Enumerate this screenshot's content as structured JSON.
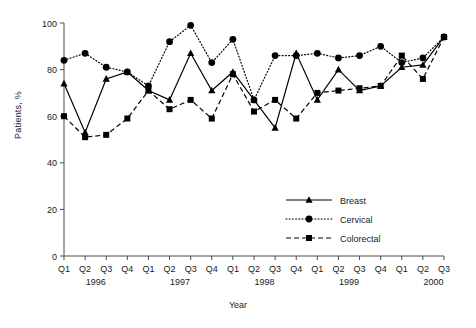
{
  "figure": {
    "ylabel": "Patients, %",
    "xlabel": "Year",
    "caption": ""
  },
  "legend": {
    "position": "inside-bottom-right",
    "items": [
      {
        "label": "Breast",
        "style": "solid",
        "marker": "triangle",
        "color": "#000000"
      },
      {
        "label": "Cervical",
        "style": "dotted",
        "marker": "circle",
        "color": "#000000"
      },
      {
        "label": "Colorectal",
        "style": "dashed",
        "marker": "square",
        "color": "#000000"
      }
    ]
  },
  "axes": {
    "y_ticks": [
      "0",
      "20",
      "40",
      "60",
      "80",
      "100"
    ],
    "y_values": [
      0,
      20,
      40,
      60,
      80,
      100
    ],
    "x_ticks": [
      "Q1",
      "Q2",
      "Q3",
      "Q4",
      "Q1",
      "Q2",
      "Q3",
      "Q4",
      "Q1",
      "Q2",
      "Q3",
      "Q4",
      "Q1",
      "Q2",
      "Q3",
      "Q4",
      "Q1",
      "Q2",
      "Q3"
    ],
    "years": [
      {
        "label": "1996",
        "index": 1.5
      },
      {
        "label": "1997",
        "index": 5.5
      },
      {
        "label": "1998",
        "index": 9.5
      },
      {
        "label": "1999",
        "index": 13.5
      },
      {
        "label": "2000",
        "index": 17.5
      }
    ]
  },
  "chart_data": {
    "type": "line",
    "title": "",
    "xlabel": "Year",
    "ylabel": "Patients, %",
    "ylim": [
      0,
      100
    ],
    "grid": false,
    "legend_position": "inside-bottom-right",
    "categories": [
      "Q1 1996",
      "Q2 1996",
      "Q3 1996",
      "Q4 1996",
      "Q1 1997",
      "Q2 1997",
      "Q3 1997",
      "Q4 1997",
      "Q1 1998",
      "Q2 1998",
      "Q3 1998",
      "Q4 1998",
      "Q1 1999",
      "Q2 1999",
      "Q3 1999",
      "Q4 1999",
      "Q1 2000",
      "Q2 2000",
      "Q3 2000"
    ],
    "series": [
      {
        "name": "Breast",
        "marker": "triangle",
        "linestyle": "solid",
        "values": [
          74,
          53,
          76,
          79,
          71,
          67,
          87,
          71,
          79,
          67,
          55,
          87,
          67,
          80,
          71,
          73,
          81,
          82,
          94
        ]
      },
      {
        "name": "Cervical",
        "marker": "circle",
        "linestyle": "dotted",
        "values": [
          84,
          87,
          81,
          79,
          73,
          92,
          99,
          83,
          93,
          67,
          86,
          86,
          87,
          85,
          86,
          90,
          83,
          85,
          94
        ]
      },
      {
        "name": "Colorectal",
        "marker": "square",
        "linestyle": "dashed",
        "values": [
          60,
          51,
          52,
          59,
          71,
          63,
          67,
          59,
          78,
          62,
          67,
          59,
          70,
          71,
          72,
          73,
          86,
          76,
          94
        ]
      }
    ]
  }
}
